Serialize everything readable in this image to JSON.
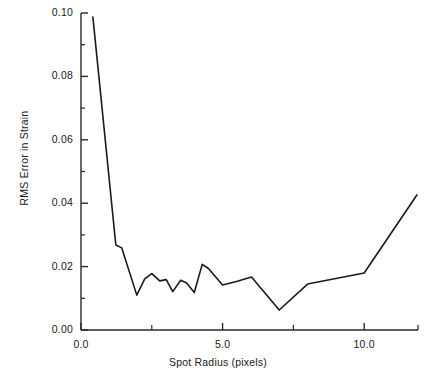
{
  "chart_data": {
    "type": "line",
    "title": "",
    "xlabel": "Spot Radius (pixels)",
    "ylabel": "RMS Error in Strain",
    "xlim": [
      0.0,
      11.9
    ],
    "ylim": [
      0.0,
      0.1
    ],
    "grid": false,
    "legend": null,
    "x_major_ticks": [
      0.0,
      5.0,
      10.0
    ],
    "x_major_tick_labels": [
      "0.0",
      "5.0",
      "10.0"
    ],
    "x_minor_ticks": [
      2.5,
      7.5,
      11.9
    ],
    "y_major_ticks": [
      0.0,
      0.02,
      0.04,
      0.06,
      0.08,
      0.1
    ],
    "y_major_tick_labels": [
      "0.00",
      "0.02",
      "0.04",
      "0.06",
      "0.08",
      "0.10"
    ],
    "y_minor_ticks": [
      0.01,
      0.03,
      0.05,
      0.07,
      0.09
    ],
    "line_color": "#1a1a1a",
    "line_width": 1.6,
    "series": [
      {
        "name": "RMS Error in Strain",
        "points": [
          [
            0.42,
            0.0987
          ],
          [
            1.23,
            0.0268
          ],
          [
            1.44,
            0.0259
          ],
          [
            1.97,
            0.011
          ],
          [
            2.25,
            0.0161
          ],
          [
            2.5,
            0.0178
          ],
          [
            2.78,
            0.0155
          ],
          [
            3.01,
            0.0159
          ],
          [
            3.24,
            0.0121
          ],
          [
            3.52,
            0.0157
          ],
          [
            3.73,
            0.0148
          ],
          [
            4.0,
            0.0118
          ],
          [
            4.28,
            0.0207
          ],
          [
            4.5,
            0.0194
          ],
          [
            5.0,
            0.0142
          ],
          [
            5.52,
            0.0154
          ],
          [
            6.02,
            0.0167
          ],
          [
            7.0,
            0.0063
          ],
          [
            8.0,
            0.0145
          ],
          [
            10.0,
            0.018
          ],
          [
            11.86,
            0.0426
          ]
        ]
      }
    ]
  },
  "axes": {
    "plot_left_px": 81,
    "plot_right_px": 418,
    "plot_top_px": 13,
    "plot_bottom_px": 330
  }
}
